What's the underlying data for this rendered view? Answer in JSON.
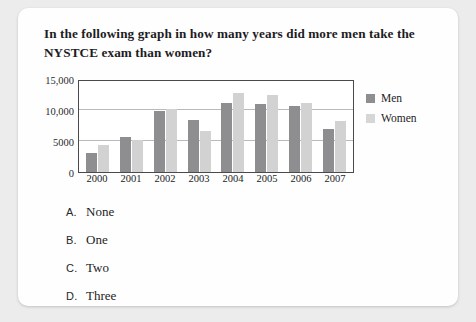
{
  "question": {
    "text": "In the following graph in how many years did more men take the NYSTCE exam than women?"
  },
  "chart_data": {
    "type": "bar",
    "title": "",
    "xlabel": "",
    "ylabel": "",
    "categories": [
      "2000",
      "2001",
      "2002",
      "2003",
      "2004",
      "2005",
      "2006",
      "2007"
    ],
    "series": [
      {
        "name": "Men",
        "color": "#8e8e90",
        "values": [
          3000,
          5600,
          9800,
          8400,
          11200,
          10900,
          10600,
          6900
        ]
      },
      {
        "name": "Women",
        "color": "#d2d2d2",
        "values": [
          4300,
          5200,
          10200,
          6600,
          12700,
          12500,
          11200,
          8300
        ]
      }
    ],
    "ylim": [
      0,
      15000
    ],
    "yticks": [
      0,
      5000,
      10000,
      15000
    ],
    "ytick_labels": [
      "0",
      "5000",
      "10,000",
      "15,000"
    ],
    "grid": true,
    "legend_position": "right"
  },
  "legend": {
    "items": [
      {
        "label": "Men"
      },
      {
        "label": "Women"
      }
    ]
  },
  "options": [
    {
      "letter": "A.",
      "text": "None"
    },
    {
      "letter": "B.",
      "text": "One"
    },
    {
      "letter": "C.",
      "text": "Two"
    },
    {
      "letter": "D.",
      "text": "Three"
    }
  ]
}
